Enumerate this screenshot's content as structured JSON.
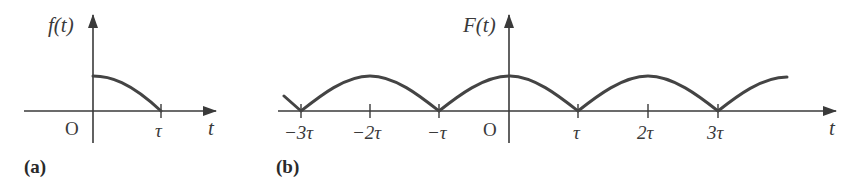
{
  "colors": {
    "ink": "#3a3a3a",
    "curve": "#444444",
    "background": "#ffffff"
  },
  "panel_a": {
    "label": "(a)",
    "y_axis_label": "f(t)",
    "x_axis_label": "t",
    "origin_label": "O",
    "ticks": [
      {
        "label": "τ",
        "value": 1
      }
    ],
    "description": "Single decaying half-cosine-like pulse from t=0 (peak) to t=τ (zero)"
  },
  "panel_b": {
    "label": "(b)",
    "y_axis_label": "F(t)",
    "x_axis_label": "t",
    "origin_label": "O",
    "ticks": [
      {
        "label": "−3τ",
        "value": -3
      },
      {
        "label": "−2τ",
        "value": -2
      },
      {
        "label": "−τ",
        "value": -1
      },
      {
        "label": "τ",
        "value": 1
      },
      {
        "label": "2τ",
        "value": 2
      },
      {
        "label": "3τ",
        "value": 3
      }
    ],
    "description": "Even periodic extension of f(t) with period 2τ; peaks at even multiples of τ, zeros at odd multiples"
  }
}
